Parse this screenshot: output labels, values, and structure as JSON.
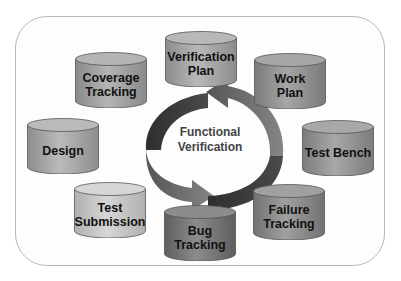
{
  "diagram": {
    "center": {
      "line1": "Functional",
      "line2": "Verification"
    },
    "nodes": [
      {
        "id": "coverage-tracking",
        "line1": "Coverage",
        "line2": "Tracking",
        "x": 75,
        "y": 52,
        "w": 72,
        "h": 56,
        "shade": "#8a8a8a",
        "top": "#b4b4b4"
      },
      {
        "id": "verification-plan",
        "line1": "Verification",
        "line2": "Plan",
        "x": 165,
        "y": 31,
        "w": 72,
        "h": 56,
        "shade": "#8c8c8c",
        "top": "#b8b8b8"
      },
      {
        "id": "work-plan",
        "line1": "Work",
        "line2": "Plan",
        "x": 254,
        "y": 53,
        "w": 72,
        "h": 56,
        "shade": "#7a7a7a",
        "top": "#a6a6a6"
      },
      {
        "id": "design",
        "line1": "Design",
        "line2": "",
        "x": 27,
        "y": 118,
        "w": 72,
        "h": 56,
        "shade": "#8e8e8e",
        "top": "#bababa"
      },
      {
        "id": "test-bench",
        "line1": "Test Bench",
        "line2": "",
        "x": 302,
        "y": 120,
        "w": 72,
        "h": 56,
        "shade": "#7c7c7c",
        "top": "#a8a8a8"
      },
      {
        "id": "test-submission",
        "line1": "Test",
        "line2": "Submission",
        "x": 74,
        "y": 182,
        "w": 72,
        "h": 56,
        "shade": "#b0b0b0",
        "top": "#d6d6d6"
      },
      {
        "id": "bug-tracking",
        "line1": "Bug",
        "line2": "Tracking",
        "x": 164,
        "y": 205,
        "w": 72,
        "h": 56,
        "shade": "#5e5e5e",
        "top": "#8c8c8c"
      },
      {
        "id": "failure-tracking",
        "line1": "Failure",
        "line2": "Tracking",
        "x": 253,
        "y": 184,
        "w": 72,
        "h": 56,
        "shade": "#727272",
        "top": "#a0a0a0"
      }
    ],
    "colors": {
      "arrow_dark": "#3a3a3a",
      "arrow_mid": "#6e6e6e",
      "frame": "#b8b8b8"
    }
  }
}
